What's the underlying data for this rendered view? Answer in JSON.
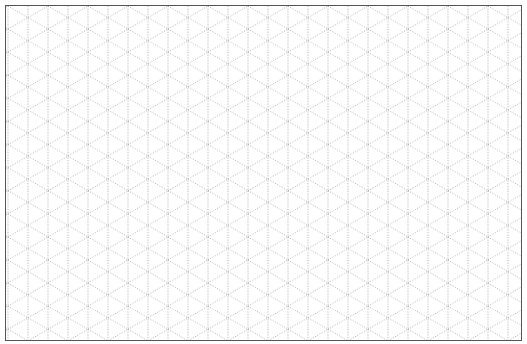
{
  "page": {
    "type": "isometric-grid-paper",
    "icon": "grid-icon"
  },
  "grid": {
    "vertical_spacing_px": 20,
    "diagonal_angle_deg": 30,
    "line_color": "#9a9a9a",
    "border_color": "#555555",
    "background": "#ffffff"
  }
}
